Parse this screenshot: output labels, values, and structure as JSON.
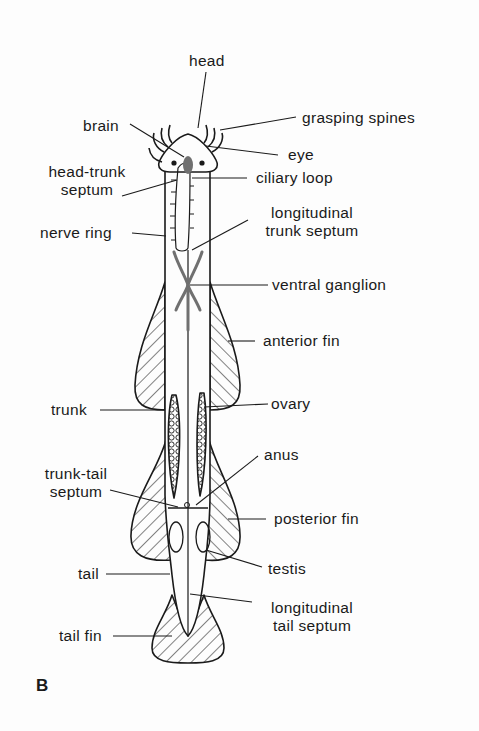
{
  "figure": {
    "panel_label": "B",
    "colors": {
      "ink": "#1a1a1a",
      "nerve_gray": "#707070",
      "background": "#fdfdfd"
    }
  },
  "labels": {
    "head": "head",
    "brain": "brain",
    "grasping_spines": "grasping spines",
    "eye": "eye",
    "head_trunk_septum_1": "head-trunk",
    "head_trunk_septum_2": "septum",
    "ciliary_loop": "ciliary loop",
    "nerve_ring": "nerve ring",
    "longitudinal_trunk_septum_1": "longitudinal",
    "longitudinal_trunk_septum_2": "trunk septum",
    "ventral_ganglion": "ventral ganglion",
    "anterior_fin": "anterior fin",
    "trunk": "trunk",
    "ovary": "ovary",
    "anus": "anus",
    "trunk_tail_septum_1": "trunk-tail",
    "trunk_tail_septum_2": "septum",
    "posterior_fin": "posterior fin",
    "tail": "tail",
    "testis": "testis",
    "longitudinal_tail_septum_1": "longitudinal",
    "longitudinal_tail_septum_2": "tail septum",
    "tail_fin": "tail fin"
  }
}
